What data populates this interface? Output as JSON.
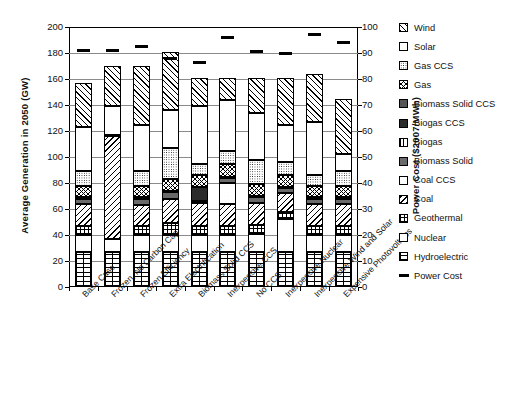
{
  "chart_data": {
    "type": "bar",
    "subtype": "stacked-bar-with-overlay-markers",
    "title": "",
    "xlabel": "",
    "ylabel": "Average Generation in 2050 (GW)",
    "y2label": "Power Cost ($2007/MWh)",
    "ylim": [
      0,
      200
    ],
    "y2lim": [
      0,
      100
    ],
    "yticks": [
      0,
      20,
      40,
      60,
      80,
      100,
      120,
      140,
      160,
      180,
      200
    ],
    "y2ticks": [
      0,
      10,
      20,
      30,
      40,
      50,
      60,
      70,
      80,
      90,
      100
    ],
    "grid": true,
    "legend_position": "right",
    "categories": [
      "Base Case",
      "Frozen, No Carbon Cap",
      "Frozen Efficiency",
      "Extra Electrification",
      "Biomass Solid CCS",
      "Inexpensive CCS",
      "No CCS",
      "Inexpensive Nuclear",
      "Inexpensive Wind and Solar",
      "Expensive Photovoltaics"
    ],
    "series": [
      {
        "name": "Hydroelectric",
        "pattern": "p-hdash",
        "values": [
          27,
          27,
          27,
          27,
          27,
          27,
          27,
          27,
          27,
          27
        ]
      },
      {
        "name": "Nuclear",
        "pattern": "p-check-med",
        "values": [
          13,
          10,
          13,
          13,
          13,
          13,
          14,
          25,
          13,
          13
        ]
      },
      {
        "name": "Geothermal",
        "pattern": "p-grid-sq",
        "values": [
          7,
          0,
          7,
          9,
          7,
          7,
          7,
          6,
          7,
          7
        ]
      },
      {
        "name": "Coal",
        "pattern": "p-diag-l",
        "values": [
          17,
          79,
          16,
          19,
          18,
          17,
          17,
          14,
          17,
          17
        ]
      },
      {
        "name": "Coal CCS",
        "pattern": "p-dots-sparse",
        "values": [
          0,
          0,
          0,
          0,
          0,
          16,
          0,
          0,
          0,
          0
        ]
      },
      {
        "name": "Biomass Solid",
        "pattern": "p-solid-gray",
        "values": [
          4,
          0,
          5,
          5,
          0,
          4,
          4,
          4,
          4,
          4
        ]
      },
      {
        "name": "Biogas",
        "pattern": "p-vlines",
        "values": [
          1,
          1,
          1,
          1,
          1,
          1,
          1,
          1,
          1,
          1
        ]
      },
      {
        "name": "Biogas CCS",
        "pattern": "p-solid-dark",
        "values": [
          0,
          0,
          0,
          0,
          11,
          0,
          0,
          0,
          0,
          0
        ]
      },
      {
        "name": "Biomass Solid CCS",
        "pattern": "p-solid-mid",
        "values": [
          0,
          0,
          0,
          0,
          0,
          0,
          0,
          0,
          0,
          0
        ]
      },
      {
        "name": "Gas",
        "pattern": "p-zigzag",
        "values": [
          9,
          0,
          9,
          9,
          9,
          10,
          9,
          9,
          9,
          9
        ]
      },
      {
        "name": "Gas CCS",
        "pattern": "p-dots-fine",
        "values": [
          11,
          0,
          11,
          24,
          9,
          10,
          19,
          10,
          8,
          11
        ]
      },
      {
        "name": "Solar",
        "pattern": "p-check-bold",
        "values": [
          34,
          22,
          36,
          29,
          44,
          39,
          36,
          29,
          41,
          13
        ]
      },
      {
        "name": "Wind",
        "pattern": "p-diag-r",
        "values": [
          34,
          31,
          45,
          45,
          22,
          17,
          27,
          36,
          37,
          43
        ]
      }
    ],
    "overlay": {
      "name": "Power Cost",
      "unit": "$2007/MWh",
      "marker": "horizontal-dash",
      "color": "#000000",
      "values": [
        91,
        91,
        92.5,
        88,
        86.5,
        96,
        90.5,
        90,
        97,
        94
      ]
    },
    "legend_entries": [
      {
        "label": "Wind",
        "swatch": "p-diag-r"
      },
      {
        "label": "Solar",
        "swatch": "p-check-bold"
      },
      {
        "label": "Gas CCS",
        "swatch": "p-dots-fine"
      },
      {
        "label": "Gas",
        "swatch": "p-zigzag"
      },
      {
        "label": "Biomass Solid CCS",
        "swatch": "p-solid-mid"
      },
      {
        "label": "Biogas CCS",
        "swatch": "p-solid-dark"
      },
      {
        "label": "Biogas",
        "swatch": "p-vlines"
      },
      {
        "label": "Biomass Solid",
        "swatch": "p-solid-gray"
      },
      {
        "label": "Coal CCS",
        "swatch": "p-dots-sparse"
      },
      {
        "label": "Coal",
        "swatch": "p-diag-l"
      },
      {
        "label": "Geothermal",
        "swatch": "p-grid-sq"
      },
      {
        "label": "Nuclear",
        "swatch": "p-check-med"
      },
      {
        "label": "Hydroelectric",
        "swatch": "p-hdash"
      },
      {
        "label": "Power Cost",
        "swatch": "line"
      }
    ]
  }
}
